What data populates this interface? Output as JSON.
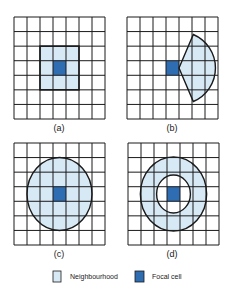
{
  "colors": {
    "neighbourhood": "#d8e9f6",
    "focal": "#2f6db3",
    "grid": "#1a1a1a",
    "background": "#ffffff"
  },
  "grid_size": {
    "rows": 7,
    "cols": 7
  },
  "focal_cell": {
    "row": 3,
    "col": 3
  },
  "panels": [
    {
      "id": "a",
      "caption": "(a)",
      "shape": "square",
      "description": "3x3 square neighbourhood around focal cell"
    },
    {
      "id": "b",
      "caption": "(b)",
      "shape": "wedge",
      "description": "Wedge / sector neighbourhood extending right from focal cell"
    },
    {
      "id": "c",
      "caption": "(c)",
      "shape": "circle",
      "description": "Circular neighbourhood centred on focal cell"
    },
    {
      "id": "d",
      "caption": "(d)",
      "shape": "annulus",
      "description": "Annular (ring) neighbourhood around focal cell"
    }
  ],
  "legend": {
    "items": [
      {
        "key": "neighbourhood",
        "label": "Neighbourhood"
      },
      {
        "key": "focal",
        "label": "Focal cell"
      }
    ]
  }
}
